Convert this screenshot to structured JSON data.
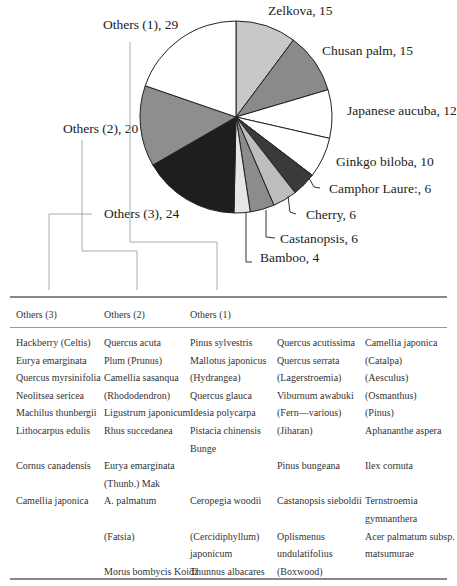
{
  "chart_data": {
    "type": "pie",
    "title": "",
    "slices": [
      {
        "label": "Zelkova",
        "value": 15,
        "color": "#c8c8c8",
        "text": "Zelkova, 15"
      },
      {
        "label": "Chusan palm",
        "value": 15,
        "color": "#8a8a8a",
        "text": "Chusan palm, 15"
      },
      {
        "label": "Japanese aucuba",
        "value": 12,
        "color": "#ffffff",
        "text": "Japanese aucuba, 12"
      },
      {
        "label": "Ginkgo biloba",
        "value": 10,
        "color": "#ffffff",
        "text": "Ginkgo biloba, 10"
      },
      {
        "label": "Camphor Laurel",
        "value": 6,
        "color": "#3a3a3a",
        "text": "Camphor Laure:, 6"
      },
      {
        "label": "Cherry",
        "value": 6,
        "color": "#bdbdbd",
        "text": "Cherry, 6"
      },
      {
        "label": "Castanopsis",
        "value": 6,
        "color": "#8c8c8c",
        "text": "Castanopsis, 6"
      },
      {
        "label": "Bamboo",
        "value": 4,
        "color": "#e6e6e6",
        "text": "Bamboo, 4"
      },
      {
        "label": "Others (3)",
        "value": 24,
        "color": "#1e1e1e",
        "text": "Others (3), 24"
      },
      {
        "label": "Others (2)",
        "value": 20,
        "color": "#8e8e8e",
        "text": "Others (2), 20"
      },
      {
        "label": "Others (1)",
        "value": 29,
        "color": "#ffffff",
        "text": "Others (1), 29"
      }
    ],
    "start_angle_deg": 0,
    "direction": "clockwise",
    "legend": "none"
  },
  "labels": {
    "zelkova": "Zelkova, 15",
    "chusan": "Chusan palm, 15",
    "aucuba": "Japanese aucuba, 12",
    "ginkgo": "Ginkgo biloba, 10",
    "camphor": "Camphor Laure:, 6",
    "cherry": "Cherry, 6",
    "castanopsis": "Castanopsis, 6",
    "bamboo": "Bamboo, 4",
    "others1": "Others (1), 29",
    "others2": "Others (2), 20",
    "others3": "Others (3), 24"
  },
  "table": {
    "headers": [
      "Others (3)",
      "Others (2)",
      "Others (1)"
    ],
    "col1": [
      "Hackberry (Celtis)",
      "Eurya emarginata",
      "Quercus myrsinifolia",
      "Neolitsea sericea",
      "Machilus thunbergii",
      "Lithocarpus edulis",
      "",
      "Cornus canadensis",
      "",
      "Camellia japonica"
    ],
    "col2": [
      "Quercus acuta",
      "Plum (Prunus)",
      "Camellia sasanqua",
      "(Rhododendron)",
      "Ligustrum japonicum",
      "Rhus succedanea",
      "",
      "Eurya        emarginata",
      "(Thunb.) Mak",
      "A. palmatum",
      "",
      "(Fatsia)",
      "",
      "Morus bombycis Koidz"
    ],
    "col3": [
      "Pinus sylvestris",
      "Mallotus japonicus",
      "(Hydrangea)",
      "Quercus glauca",
      "Idesia polycarpa",
      "Pistacia          chinensis",
      "Bunge",
      "",
      "",
      "Ceropegia woodii",
      "",
      "(Cercidiphyllum)",
      "japonicum",
      "Thunnus albacares"
    ],
    "col4": [
      "Quercus acutissima",
      "Quercus serrata",
      "(Lagerstroemia)",
      "Viburnum awabuki",
      "(Fern—various)",
      "(Jiharan)",
      "",
      "Pinus bungeana",
      "",
      "Castanopsis sieboldii",
      "",
      "Oplismenus",
      "undulatifolius",
      "(Boxwood)"
    ],
    "col5": [
      "Camellia japonica",
      "(Catalpa)",
      "(Aesculus)",
      "(Osmanthus)",
      "(Pinus)",
      "Aphananthe aspera",
      "",
      "Ilex cornuta",
      "",
      "Ternstroemia",
      "gymnanthera",
      "Acer  palmatum  subsp.",
      "matsumurae",
      ""
    ]
  }
}
